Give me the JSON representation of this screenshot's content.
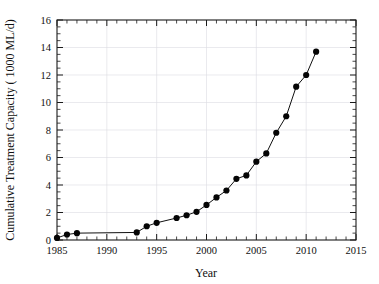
{
  "chart_data": {
    "type": "line",
    "title": "",
    "xlabel": "Year",
    "ylabel": "Cumulative Treatment Capacity ( 1000 ML/d)",
    "xlim": [
      1985,
      2015
    ],
    "ylim": [
      0,
      16
    ],
    "x_ticks": [
      1985,
      1990,
      1995,
      2000,
      2005,
      2010,
      2015
    ],
    "x_tick_labels": [
      "1985",
      "1990",
      "1995",
      "2000",
      "2005",
      "2010",
      "2015"
    ],
    "x_minor_tick_interval": 1,
    "y_ticks": [
      0,
      2,
      4,
      6,
      8,
      10,
      12,
      14,
      16
    ],
    "y_tick_labels": [
      "0",
      "2",
      "4",
      "6",
      "8",
      "10",
      "12",
      "14",
      "16"
    ],
    "y_minor_tick_interval": 0.5,
    "grid": true,
    "grid_color": "#dcdce2",
    "legend": null,
    "legend_position": "none",
    "marker": "filled-circle",
    "marker_color": "#050505",
    "line_color": "#111111",
    "series": [
      {
        "name": "Cumulative Treatment Capacity",
        "x": [
          1985,
          1986,
          1987,
          1993,
          1994,
          1995,
          1997,
          1998,
          1999,
          2000,
          2001,
          2002,
          2003,
          2004,
          2005,
          2006,
          2007,
          2008,
          2009,
          2010,
          2011
        ],
        "values": [
          0.15,
          0.4,
          0.5,
          0.55,
          1.0,
          1.25,
          1.6,
          1.8,
          2.05,
          2.55,
          3.1,
          3.6,
          4.45,
          4.7,
          5.7,
          6.3,
          7.8,
          9.0,
          11.15,
          12.0,
          13.7
        ]
      }
    ]
  },
  "axis_titles": {
    "x": "Year",
    "y": "Cumulative Treatment Capacity ( 1000 ML/d)"
  }
}
